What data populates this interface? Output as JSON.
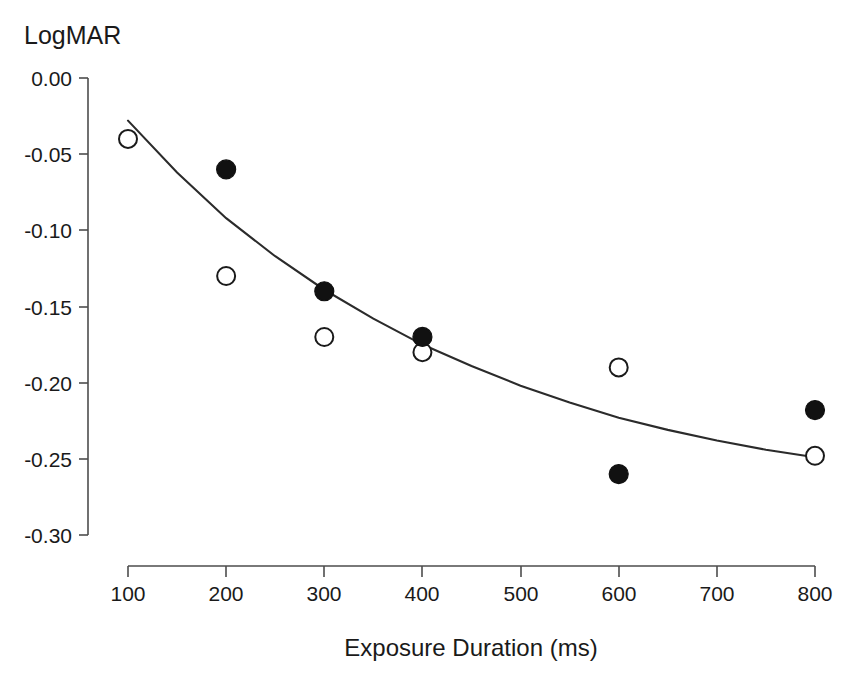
{
  "chart_data": {
    "type": "scatter",
    "title": "",
    "ylabel": "LogMAR",
    "xlabel": "Exposure Duration (ms)",
    "xlim": [
      100,
      800
    ],
    "ylim": [
      -0.3,
      0.0
    ],
    "grid": false,
    "legend": "none",
    "x_ticks": [
      100,
      200,
      300,
      400,
      500,
      600,
      700,
      800
    ],
    "x_tick_labels": [
      "100",
      "200",
      "300",
      "400",
      "500",
      "600",
      "700",
      "800"
    ],
    "y_ticks": [
      0.0,
      -0.05,
      -0.1,
      -0.15,
      -0.2,
      -0.25,
      -0.3
    ],
    "y_tick_labels": [
      "0.00",
      "-0.05",
      "-0.10",
      "-0.15",
      "-0.20",
      "-0.25",
      "-0.30"
    ],
    "series": [
      {
        "name": "open-circles",
        "marker": "open circle",
        "x": [
          100,
          200,
          300,
          400,
          600,
          800
        ],
        "values": [
          -0.04,
          -0.13,
          -0.17,
          -0.18,
          -0.19,
          -0.248
        ]
      },
      {
        "name": "filled-circles",
        "marker": "filled circle",
        "x": [
          200,
          300,
          400,
          600,
          800
        ],
        "values": [
          -0.06,
          -0.14,
          -0.17,
          -0.26,
          -0.218
        ]
      }
    ],
    "fit_curve": {
      "name": "fitted exponential curve",
      "x": [
        100,
        150,
        200,
        250,
        300,
        350,
        400,
        450,
        500,
        550,
        600,
        650,
        700,
        750,
        800
      ],
      "values": [
        -0.028,
        -0.062,
        -0.092,
        -0.117,
        -0.139,
        -0.158,
        -0.175,
        -0.189,
        -0.202,
        -0.213,
        -0.223,
        -0.231,
        -0.238,
        -0.244,
        -0.249
      ]
    }
  },
  "colors": {
    "axis": "#4d4d4d",
    "curve": "#2b2b2b",
    "filled_marker": "#111111",
    "open_marker_stroke": "#1a1a1a",
    "background": "#ffffff",
    "text": "#1a1a1a"
  }
}
